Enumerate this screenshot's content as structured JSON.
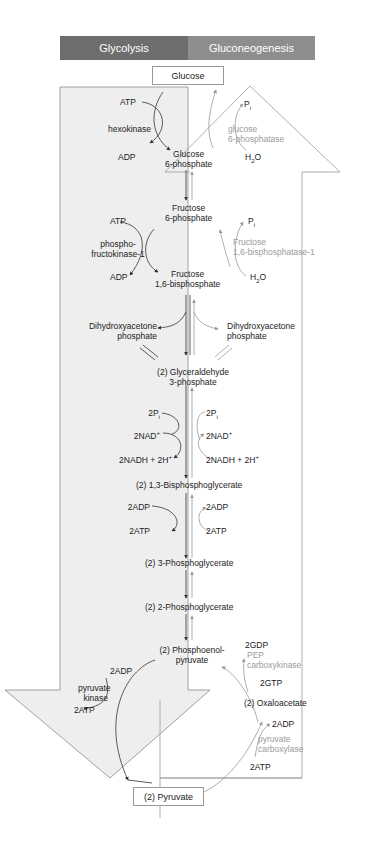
{
  "header": {
    "left": "Glycolysis",
    "right": "Gluconeogenesis",
    "left_color": "#6e6e6e",
    "right_color": "#8e8e8e"
  },
  "boxes": {
    "start": "Glucose",
    "end": "(2) Pyruvate"
  },
  "metabolites": {
    "g6p_1": "Glucose",
    "g6p_2": "6-phosphate",
    "f6p_1": "Fructose",
    "f6p_2": "6-phosphate",
    "f16bp_1": "Fructose",
    "f16bp_2": "1,6-bisphosphate",
    "dhap_left_1": "Dihydroxyacetone",
    "dhap_left_2": "phosphate",
    "dhap_right_1": "Dihydroxyacetone",
    "dhap_right_2": "phosphate",
    "g3p_1": "(2) Glyceraldehyde",
    "g3p_2": "3-phosphate",
    "bpg": "(2) 1,3-Bisphosphoglycerate",
    "pg3": "(2) 3-Phosphoglycerate",
    "pg2": "(2) 2-Phosphoglycerate",
    "pep_1": "(2) Phosphoenol-",
    "pep_2": "pyruvate",
    "oaa": "(2) Oxaloacetate"
  },
  "glycolysis_side": {
    "hk_in": "ATP",
    "hk_enzyme": "hexokinase",
    "hk_out": "ADP",
    "pfk_in": "ATP",
    "pfk_enzyme_1": "phospho-",
    "pfk_enzyme_2": "fructokinase-1",
    "pfk_out": "ADP",
    "gapdh_pi": "2P",
    "gapdh_nad": "2NAD",
    "gapdh_nadh": "2NADH + 2H",
    "pgk_in": "2ADP",
    "pgk_out": "2ATP",
    "pk_in": "2ADP",
    "pk_enzyme_1": "pyruvate",
    "pk_enzyme_2": "kinase",
    "pk_out": "2ATP"
  },
  "gluconeogenesis_side": {
    "g6pase_out": "P",
    "g6pase_enzyme_1": "glucose",
    "g6pase_enzyme_2": "6-phosphatase",
    "g6pase_in": "H",
    "fbpase_out": "P",
    "fbpase_enzyme_1": "Fructose",
    "fbpase_enzyme_2": "1,6-bisphosphatase-1",
    "fbpase_in": "H",
    "gapdh_pi": "2P",
    "gapdh_nad": "2NAD",
    "gapdh_nadh": "2NADH + 2H",
    "pgk_adp": "2ADP",
    "pgk_atp": "2ATP",
    "pepck_out": "2GDP",
    "pepck_enzyme_1": "PEP",
    "pepck_enzyme_2": "carboxykinase",
    "pepck_in": "2GTP",
    "pc_out": "2ADP",
    "pc_enzyme_1": "pyruvate",
    "pc_enzyme_2": "carboxylase",
    "pc_in": "2ATP"
  },
  "glyphs": {
    "sub_i": "i",
    "sub_2": "2",
    "sup_plus": "+",
    "water_o": "O"
  }
}
